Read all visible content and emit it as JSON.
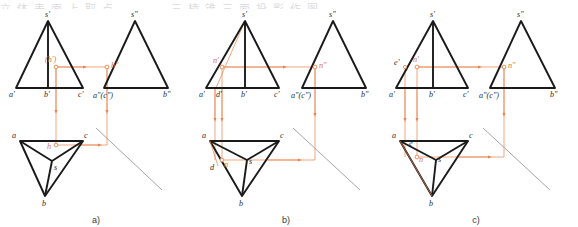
{
  "figure": {
    "title_strip": "立体表面上取点 —— 三棱锥三面投影作图",
    "panels": [
      {
        "id": "a",
        "caption": "a)",
        "front_view": {
          "apex_label": "s'",
          "base_labels": [
            "a'",
            "b'",
            "c'"
          ],
          "point_label": "(h')",
          "point_marker": "circle"
        },
        "side_view": {
          "apex_label": "s\"",
          "base_labels": [
            "a\"(c\")",
            "b\""
          ],
          "point_label": "h\"",
          "point_marker": "circle"
        },
        "top_view": {
          "vertex_labels": [
            "a",
            "b",
            "c"
          ],
          "center_label": "s",
          "point_label": "h",
          "point_marker": "circle"
        },
        "construction": {
          "miter_line": "45-degree",
          "projection_color": "#e8834a",
          "arrows": 5
        }
      },
      {
        "id": "b",
        "caption": "b)",
        "front_view": {
          "apex_label": "s'",
          "base_labels": [
            "a'",
            "d'",
            "b'",
            "c'"
          ],
          "point_label": "n'",
          "point_marker": "circle"
        },
        "side_view": {
          "apex_label": "s\"",
          "base_labels": [
            "a\"(c\")",
            "b\""
          ],
          "point_label": "n\"",
          "point_marker": "circle"
        },
        "top_view": {
          "vertex_labels": [
            "a",
            "b",
            "c"
          ],
          "center_label": "s",
          "point_label": "n",
          "aux_label": "d",
          "point_marker": "circle"
        },
        "construction": {
          "miter_line": "45-degree",
          "projection_color": "#e8834a",
          "arrows": 5
        }
      },
      {
        "id": "c",
        "caption": "c)",
        "front_view": {
          "apex_label": "s'",
          "base_labels": [
            "a'",
            "b'",
            "c'"
          ],
          "point_label": "n'",
          "aux_label": "e'",
          "point_marker": "circle"
        },
        "side_view": {
          "apex_label": "s\"",
          "base_labels": [
            "a\"(c\")",
            "b\""
          ],
          "point_label": "n\"",
          "point_marker": "circle"
        },
        "top_view": {
          "vertex_labels": [
            "a",
            "b",
            "c"
          ],
          "center_label": "s",
          "point_label": "n",
          "aux_label": "e",
          "point_marker": "circle"
        },
        "construction": {
          "miter_line": "45-degree",
          "projection_color": "#e8834a",
          "arrows": 5
        }
      }
    ]
  },
  "colors": {
    "object_line": "#1a1a1a",
    "projection_line": "#e8834a",
    "miter_line": "#8d8d8d",
    "label_text": "#2b2b2b",
    "caption_text": "#3a3a3a"
  }
}
